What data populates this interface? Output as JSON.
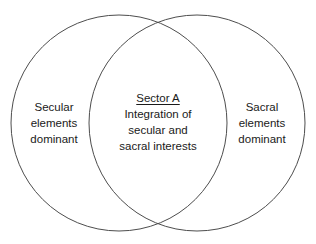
{
  "diagram": {
    "type": "venn-two-circle",
    "background_color": "#ffffff",
    "stroke_color": "#4d4d4d",
    "text_color": "#1a1a1a",
    "left_circle": {
      "name": "secular-circle",
      "cx": 119,
      "cy": 123,
      "r": 108,
      "lines": [
        "Secular",
        "elements",
        "dominant"
      ],
      "line1": "Secular",
      "line2": "elements",
      "line3": "dominant"
    },
    "right_circle": {
      "name": "sacral-circle",
      "cx": 197,
      "cy": 123,
      "r": 108,
      "lines": [
        "Sacral",
        "elements",
        "dominant"
      ],
      "line1": "Sacral",
      "line2": "elements",
      "line3": "dominant"
    },
    "intersection": {
      "name": "sector-a-overlap",
      "title": "Sector A",
      "lines": [
        "Integration of",
        "secular and",
        "sacral interests"
      ],
      "line1": "Integration of",
      "line2": "secular and",
      "line3": "sacral interests"
    }
  }
}
